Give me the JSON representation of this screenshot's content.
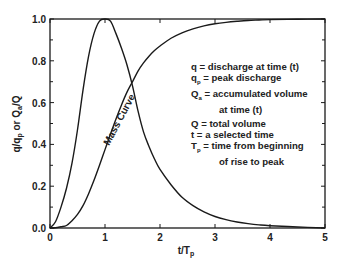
{
  "chart_data": {
    "type": "line",
    "title": "",
    "xlabel": "t/T_p",
    "ylabel": "q/q_p or Q_a/Q",
    "xlim": [
      0,
      5
    ],
    "ylim": [
      0,
      1.0
    ],
    "x_ticks": [
      "0",
      "1",
      "2",
      "3",
      "4",
      "5"
    ],
    "y_ticks": [
      "0.0",
      "0.2",
      "0.4",
      "0.6",
      "0.8",
      "1.0"
    ],
    "grid": false,
    "legend_position": "right-middle (text block)",
    "x": [
      0,
      0.1,
      0.2,
      0.3,
      0.4,
      0.5,
      0.6,
      0.7,
      0.8,
      0.9,
      1.0,
      1.1,
      1.2,
      1.3,
      1.4,
      1.5,
      1.6,
      1.7,
      1.8,
      1.9,
      2.0,
      2.2,
      2.4,
      2.6,
      2.8,
      3.0,
      3.2,
      3.4,
      3.6,
      3.8,
      4.0,
      4.5,
      5.0
    ],
    "series": [
      {
        "name": "Dimensionless unit hydrograph (q/q_p)",
        "values": [
          0,
          0.03,
          0.1,
          0.19,
          0.31,
          0.47,
          0.66,
          0.82,
          0.93,
          0.99,
          1.0,
          0.99,
          0.93,
          0.86,
          0.78,
          0.68,
          0.56,
          0.46,
          0.39,
          0.33,
          0.28,
          0.207,
          0.147,
          0.107,
          0.077,
          0.055,
          0.04,
          0.029,
          0.021,
          0.015,
          0.011,
          0.005,
          0.0
        ]
      },
      {
        "name": "Mass Curve (Q_a/Q)",
        "values": [
          0,
          0.001,
          0.006,
          0.012,
          0.035,
          0.065,
          0.107,
          0.163,
          0.228,
          0.3,
          0.375,
          0.45,
          0.522,
          0.589,
          0.65,
          0.7,
          0.751,
          0.79,
          0.822,
          0.849,
          0.871,
          0.908,
          0.934,
          0.953,
          0.967,
          0.977,
          0.984,
          0.989,
          0.993,
          0.995,
          0.997,
          0.999,
          1.0
        ]
      }
    ],
    "annotations": [
      "Mass Curve"
    ]
  },
  "labels": {
    "ylabel_parts": {
      "q": "q/q",
      "p": "p",
      "or": " or Q",
      "a": "a",
      "end": "/Q"
    },
    "xlabel_parts": {
      "main": "t/T",
      "sub": "p"
    },
    "mass_curve": "Mass Curve"
  },
  "legend": {
    "lines": [
      {
        "sym": "q",
        "sub": "",
        "text": " = discharge at time (t)"
      },
      {
        "sym": "q",
        "sub": "p",
        "text": " = peak discharge"
      },
      {
        "sym": "Q",
        "sub": "a",
        "text": " = accumulated volume"
      },
      {
        "sym": "",
        "sub": "",
        "text": "at time (t)",
        "indent": true
      },
      {
        "sym": "Q",
        "sub": "",
        "text": " = total volume"
      },
      {
        "sym": "t",
        "sub": "",
        "text": " = a selected time"
      },
      {
        "sym": "T",
        "sub": "p",
        "text": " = time from beginning"
      },
      {
        "sym": "",
        "sub": "",
        "text": "of rise to peak",
        "indent": true
      }
    ]
  },
  "colors": {
    "line": "#1a1a1a",
    "axis": "#1a1a1a",
    "background": "#ffffff"
  }
}
